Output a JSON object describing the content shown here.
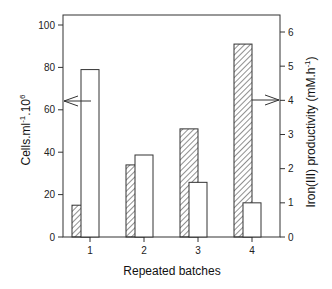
{
  "chart_data": {
    "type": "bar",
    "title": "",
    "xlabel": "Repeated batches",
    "ylabel_left": "Cells.ml-1.10^6",
    "ylabel_left_parts": {
      "base": "Cells.ml",
      "sup1": "-1",
      "mid": ".10",
      "sup2": "6"
    },
    "ylabel_right": "Iron(III) productivity (mM.h-1)",
    "ylabel_right_parts": {
      "base": "Iron(III) productivity (mM.h",
      "sup": "-1",
      "end": ")"
    },
    "categories": [
      "1",
      "2",
      "3",
      "4"
    ],
    "series": [
      {
        "name": "Cells",
        "axis": "left",
        "style": "hatched",
        "values": [
          15,
          34,
          51,
          91
        ]
      },
      {
        "name": "Iron(III) productivity",
        "axis": "right",
        "style": "open",
        "values": [
          4.9,
          2.4,
          1.6,
          1.0
        ]
      }
    ],
    "ylim_left": [
      0,
      100
    ],
    "ylim_right": [
      0,
      6
    ],
    "yticks_left": [
      0,
      20,
      40,
      60,
      80,
      100
    ],
    "yticks_right": [
      0,
      1,
      2,
      3,
      4,
      5,
      6
    ],
    "grid": false,
    "legend": "none",
    "annotations": [
      {
        "type": "arrow",
        "direction": "left",
        "meaning": "hatched bars refer to left axis"
      },
      {
        "type": "arrow",
        "direction": "right",
        "meaning": "open bars refer to right axis"
      }
    ]
  },
  "colors": {
    "axis": "#333333",
    "bar_stroke": "#333333",
    "bar_fill_open": "#ffffff",
    "hatch": "#333333"
  }
}
